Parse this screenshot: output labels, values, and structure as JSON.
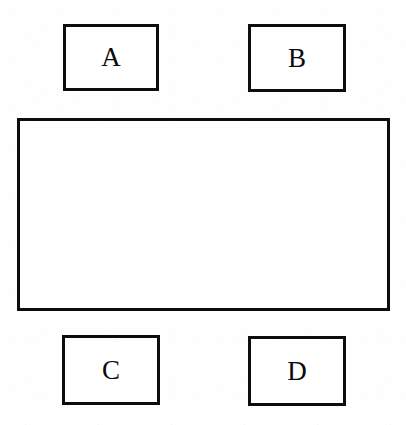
{
  "figure": {
    "type": "line-diagram",
    "background_color": "#ffffff",
    "stroke_color": "#0d0d0d",
    "boxes": [
      {
        "id": "a",
        "label": "A",
        "position": "top-left"
      },
      {
        "id": "b",
        "label": "B",
        "position": "top-right"
      },
      {
        "id": "c",
        "label": "C",
        "position": "bottom-left"
      },
      {
        "id": "d",
        "label": "D",
        "position": "bottom-right"
      }
    ],
    "center": {
      "id": "center",
      "label": ""
    }
  }
}
